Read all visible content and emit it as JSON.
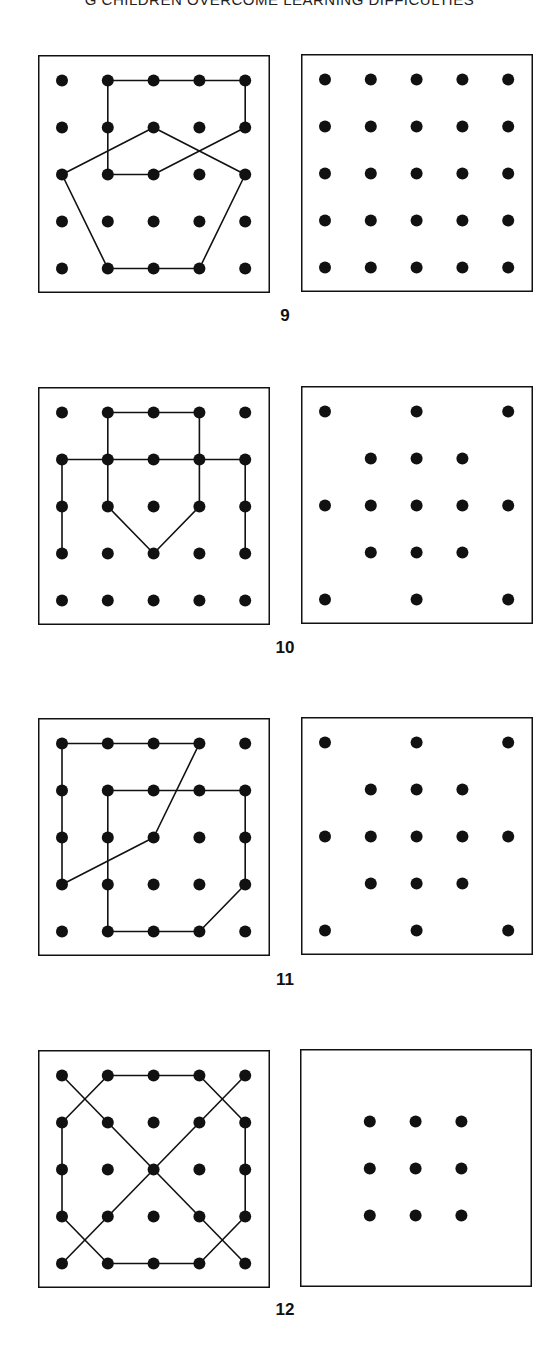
{
  "header": {
    "title": "G CHILDREN OVERCOME LEARNING DIFFICULTIES"
  },
  "colors": {
    "ink": "#111111",
    "paper": "#ffffff"
  },
  "grid": {
    "cols": 5,
    "rows": 5,
    "dot_radius": 6
  },
  "figures": [
    {
      "number": "9",
      "left": {
        "dots": "all",
        "paths": [
          [
            [
              1,
              0
            ],
            [
              4,
              0
            ],
            [
              4,
              1
            ],
            [
              2,
              2
            ],
            [
              1,
              2
            ],
            [
              1,
              0
            ]
          ],
          [
            [
              0,
              2
            ],
            [
              2,
              1
            ],
            [
              4,
              2
            ],
            [
              3,
              4
            ],
            [
              2,
              4
            ],
            [
              1,
              4
            ],
            [
              0,
              2
            ]
          ]
        ]
      },
      "right": {
        "dots": "all",
        "paths": []
      }
    },
    {
      "number": "10",
      "left": {
        "dots": "all",
        "paths": [
          [
            [
              1,
              2
            ],
            [
              1,
              0
            ],
            [
              3,
              0
            ],
            [
              3,
              2
            ],
            [
              2,
              3
            ],
            [
              1,
              2
            ]
          ],
          [
            [
              0,
              3
            ],
            [
              0,
              1
            ],
            [
              4,
              1
            ],
            [
              4,
              3
            ]
          ]
        ]
      },
      "right": {
        "dots": "diamond17",
        "paths": []
      }
    },
    {
      "number": "11",
      "left": {
        "dots": "all",
        "paths": [
          [
            [
              0,
              0
            ],
            [
              3,
              0
            ],
            [
              2,
              2
            ],
            [
              0,
              3
            ],
            [
              0,
              0
            ]
          ],
          [
            [
              1,
              1
            ],
            [
              4,
              1
            ],
            [
              4,
              3
            ],
            [
              3,
              4
            ],
            [
              1,
              4
            ],
            [
              1,
              1
            ]
          ]
        ]
      },
      "right": {
        "dots": "diamond17",
        "paths": []
      }
    },
    {
      "number": "12",
      "left": {
        "dots": "all",
        "paths": [
          [
            [
              1,
              0
            ],
            [
              3,
              0
            ],
            [
              4,
              1
            ],
            [
              4,
              3
            ],
            [
              3,
              4
            ],
            [
              1,
              4
            ],
            [
              0,
              3
            ],
            [
              0,
              1
            ],
            [
              1,
              0
            ]
          ],
          [
            [
              0,
              0
            ],
            [
              4,
              4
            ]
          ],
          [
            [
              4,
              0
            ],
            [
              0,
              4
            ]
          ]
        ]
      },
      "right": {
        "dots": "inner9",
        "paths": []
      }
    }
  ]
}
